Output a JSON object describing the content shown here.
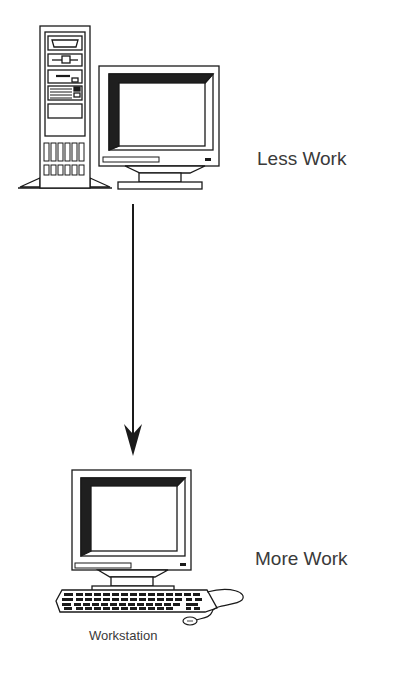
{
  "diagram": {
    "top_node": {
      "label": "Less Work",
      "icon": "desktop-tower-with-monitor"
    },
    "bottom_node": {
      "label": "More Work",
      "caption": "Workstation",
      "icon": "workstation-monitor-keyboard-mouse"
    },
    "edge": {
      "from": "top_node",
      "to": "bottom_node",
      "style": "arrow-down"
    },
    "colors": {
      "line": "#1a1a1a",
      "text": "#3a3a3a",
      "background": "#ffffff"
    }
  }
}
